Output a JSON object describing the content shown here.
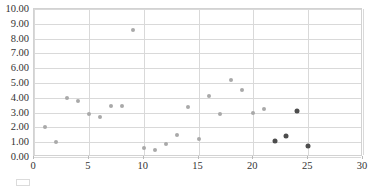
{
  "chart_data": {
    "type": "scatter",
    "title": "",
    "xlabel": "",
    "ylabel": "",
    "xlim": [
      0,
      30
    ],
    "ylim": [
      0,
      10
    ],
    "xticks": [
      0,
      5,
      10,
      15,
      20,
      25,
      30
    ],
    "yticks": [
      0,
      1,
      2,
      3,
      4,
      5,
      6,
      7,
      8,
      9,
      10
    ],
    "xtick_labels": [
      "0",
      "5",
      "10",
      "15",
      "20",
      "25",
      "30"
    ],
    "ytick_labels": [
      "0.00",
      "1.00",
      "2.00",
      "3.00",
      "4.00",
      "5.00",
      "6.00",
      "7.00",
      "8.00",
      "9.00",
      "10.00"
    ],
    "grid": "both",
    "legend": "none",
    "series": [
      {
        "name": "series-a",
        "color": "#a9a9a9",
        "marker": "circle",
        "points": [
          [
            1,
            2.02
          ],
          [
            2,
            1.04
          ],
          [
            3,
            3.97
          ],
          [
            4,
            3.79
          ],
          [
            5,
            2.9
          ],
          [
            6,
            2.73
          ],
          [
            7,
            3.44
          ],
          [
            8,
            3.46
          ],
          [
            9,
            8.6
          ],
          [
            10,
            0.63
          ],
          [
            11,
            0.44
          ],
          [
            12,
            0.87
          ],
          [
            13,
            1.46
          ],
          [
            14,
            3.41
          ],
          [
            15,
            1.25
          ],
          [
            16,
            4.09
          ],
          [
            17,
            2.88
          ],
          [
            18,
            5.21
          ],
          [
            19,
            4.5
          ],
          [
            20,
            2.95
          ],
          [
            21,
            3.25
          ]
        ]
      },
      {
        "name": "series-b",
        "color": "#4d4d4d",
        "marker": "circle",
        "points": [
          [
            22,
            1.06
          ],
          [
            23,
            1.4
          ],
          [
            24,
            3.1
          ],
          [
            25,
            0.76
          ]
        ]
      }
    ]
  },
  "colors": {
    "series_a": "#a9a9a9",
    "series_b": "#4d4d4d",
    "grid": "#d9d9d9",
    "frame": "#d2d2d2",
    "text": "#333333",
    "background": "#ffffff"
  }
}
